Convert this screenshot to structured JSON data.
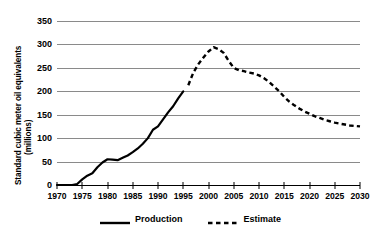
{
  "chart_data": {
    "type": "line",
    "title": "",
    "xlabel": "",
    "ylabel": "Standard cubic meter oil equivalents",
    "ylabel_unit": "(millions)",
    "xlim": [
      1970,
      2030
    ],
    "ylim": [
      0,
      350
    ],
    "grid": true,
    "legend_position": "bottom",
    "yticks": [
      0,
      50,
      100,
      150,
      200,
      250,
      300,
      350
    ],
    "xticks": [
      1970,
      1975,
      1980,
      1985,
      1990,
      1995,
      2000,
      2005,
      2010,
      2015,
      2020,
      2025,
      2030
    ],
    "series": [
      {
        "name": "Production",
        "style": "solid",
        "color": "#000000",
        "x": [
          1970,
          1971,
          1972,
          1973,
          1974,
          1975,
          1976,
          1977,
          1978,
          1979,
          1980,
          1981,
          1982,
          1983,
          1984,
          1985,
          1986,
          1987,
          1988,
          1989,
          1990,
          1991,
          1992,
          1993,
          1994,
          1995
        ],
        "values": [
          0,
          0,
          0,
          0,
          2,
          12,
          20,
          25,
          38,
          48,
          55,
          54,
          53,
          58,
          63,
          70,
          78,
          88,
          100,
          118,
          125,
          140,
          155,
          168,
          185,
          200
        ]
      },
      {
        "name": "Estimate",
        "style": "dashed",
        "color": "#000000",
        "x": [
          1996,
          1997,
          1998,
          1999,
          2000,
          2001,
          2002,
          2003,
          2004,
          2005,
          2006,
          2007,
          2008,
          2009,
          2010,
          2011,
          2012,
          2013,
          2014,
          2015,
          2016,
          2017,
          2018,
          2019,
          2020,
          2021,
          2022,
          2023,
          2024,
          2025,
          2026,
          2027,
          2028,
          2029,
          2030
        ],
        "values": [
          213,
          240,
          258,
          272,
          285,
          294,
          290,
          282,
          265,
          250,
          245,
          243,
          240,
          238,
          234,
          228,
          220,
          210,
          200,
          188,
          178,
          170,
          163,
          157,
          152,
          147,
          143,
          139,
          136,
          133,
          131,
          129,
          127,
          126,
          125
        ]
      }
    ]
  },
  "legend": {
    "items": [
      {
        "label": "Production",
        "style": "solid"
      },
      {
        "label": "Estimate",
        "style": "dashed"
      }
    ]
  }
}
